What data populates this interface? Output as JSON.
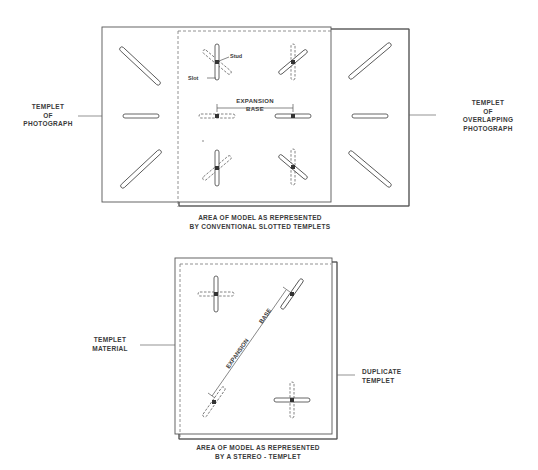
{
  "figure": {
    "top_diagram": {
      "left_label": [
        "TEMPLET",
        "OF",
        "PHOTOGRAPH"
      ],
      "right_label": [
        "TEMPLET",
        "OF",
        "OVERLAPPING",
        "PHOTOGRAPH"
      ],
      "stud_label": "Stud",
      "slot_label": "Slot",
      "expansion_base_label": [
        "EXPANSION",
        "BASE"
      ],
      "caption": [
        "AREA  OF MODEL AS REPRESENTED",
        "BY CONVENTIONAL SLOTTED TEMPLETS"
      ]
    },
    "bottom_diagram": {
      "left_label": [
        "TEMPLET",
        "MATERIAL"
      ],
      "right_label": [
        "DUPLICATE",
        "TEMPLET"
      ],
      "diagonal_text_1": "EXPANSION",
      "diagonal_text_2": "BASE",
      "caption": [
        "AREA  OF MODEL AS REPRESENTED",
        "BY A STEREO - TEMPLET"
      ]
    },
    "colors": {
      "line": "#555555",
      "text": "#3a3a3a",
      "background": "#ffffff"
    }
  }
}
